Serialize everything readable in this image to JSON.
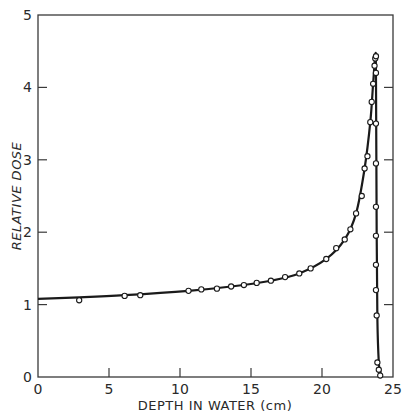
{
  "chart_data": {
    "type": "line",
    "title": "",
    "xlabel": "DEPTH IN WATER (cm)",
    "ylabel": "RELATIVE DOSE",
    "xlim": [
      0,
      25
    ],
    "ylim": [
      0,
      5
    ],
    "xticks": [
      0,
      5,
      10,
      15,
      20,
      25
    ],
    "yticks": [
      0,
      1,
      2,
      3,
      4,
      5
    ],
    "grid": false,
    "legend": null,
    "series": [
      {
        "name": "Relative dose (Bragg curve)",
        "markers": "open-circle",
        "x": [
          2.9,
          6.1,
          7.2,
          10.6,
          11.5,
          12.6,
          13.6,
          14.5,
          15.4,
          16.4,
          17.4,
          18.4,
          19.2,
          20.3,
          21.0,
          21.6,
          22.0,
          22.4,
          22.8,
          23.0,
          23.2,
          23.4,
          23.5,
          23.6,
          23.7,
          23.75,
          23.8,
          23.8,
          23.8,
          23.8,
          23.8,
          23.8,
          23.8,
          23.8,
          23.85,
          23.9,
          24.0,
          24.1
        ],
        "y": [
          1.06,
          1.12,
          1.13,
          1.19,
          1.21,
          1.22,
          1.25,
          1.27,
          1.3,
          1.33,
          1.38,
          1.43,
          1.5,
          1.63,
          1.78,
          1.9,
          2.04,
          2.26,
          2.5,
          2.88,
          3.05,
          3.52,
          3.8,
          4.05,
          4.3,
          4.4,
          4.43,
          4.2,
          3.5,
          2.95,
          2.35,
          1.95,
          1.55,
          1.2,
          0.85,
          0.2,
          0.1,
          0.02
        ]
      }
    ],
    "curve": {
      "x": [
        0,
        2.9,
        6.1,
        10.6,
        13.6,
        16.4,
        18.4,
        20.3,
        21.6,
        22.4,
        23.0,
        23.4,
        23.6,
        23.75,
        23.8,
        23.85,
        23.9,
        24.0,
        24.1,
        24.2
      ],
      "y": [
        1.08,
        1.1,
        1.13,
        1.19,
        1.25,
        1.33,
        1.43,
        1.63,
        1.9,
        2.26,
        2.88,
        3.52,
        4.05,
        4.43,
        4.2,
        2.0,
        0.8,
        0.2,
        0.08,
        0.0
      ]
    }
  },
  "axes": {
    "x_title": "DEPTH IN WATER (cm)",
    "y_title": "RELATIVE DOSE",
    "x_tick_labels": [
      "0",
      "5",
      "10",
      "15",
      "20",
      "25"
    ],
    "y_tick_labels": [
      "0",
      "1",
      "2",
      "3",
      "4",
      "5"
    ]
  },
  "colors": {
    "line": "#1a1a1a",
    "frame": "#3a3a3a",
    "marker_fill": "#ffffff"
  }
}
